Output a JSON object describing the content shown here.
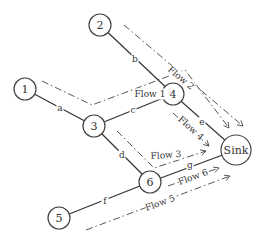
{
  "diagram": {
    "type": "network flow diagram",
    "nodes": [
      {
        "id": "1",
        "label": "1",
        "x": 25,
        "y": 89,
        "r": 11
      },
      {
        "id": "2",
        "label": "2",
        "x": 100,
        "y": 25,
        "r": 11
      },
      {
        "id": "3",
        "label": "3",
        "x": 94,
        "y": 126,
        "r": 11
      },
      {
        "id": "4",
        "label": "4",
        "x": 173,
        "y": 94,
        "r": 11
      },
      {
        "id": "5",
        "label": "5",
        "x": 59,
        "y": 218,
        "r": 11
      },
      {
        "id": "6",
        "label": "6",
        "x": 150,
        "y": 182,
        "r": 11
      },
      {
        "id": "sink",
        "label": "Sink",
        "x": 236,
        "y": 150,
        "r": 15
      }
    ],
    "edges": [
      {
        "id": "a",
        "label": "a",
        "from": "1",
        "to": "3",
        "lx": 60,
        "ly": 108
      },
      {
        "id": "b",
        "label": "b",
        "from": "2",
        "to": "4",
        "lx": 135,
        "ly": 59
      },
      {
        "id": "c",
        "label": "c",
        "from": "3",
        "to": "4",
        "lx": 133,
        "ly": 110
      },
      {
        "id": "d",
        "label": "d",
        "from": "3",
        "to": "6",
        "lx": 122,
        "ly": 155
      },
      {
        "id": "e",
        "label": "e",
        "from": "4",
        "to": "sink",
        "lx": 202,
        "ly": 122
      },
      {
        "id": "f",
        "label": "f",
        "from": "5",
        "to": "6",
        "lx": 105,
        "ly": 201
      },
      {
        "id": "g",
        "label": "g",
        "from": "6",
        "to": "sink",
        "lx": 190,
        "ly": 165
      }
    ],
    "flows": [
      {
        "id": "flow1",
        "label": "Flow 1",
        "path": "1 → 3 → 4 → Sink",
        "points": [
          [
            42,
            81
          ],
          [
            92,
            105
          ],
          [
            185,
            70
          ],
          [
            229,
            128
          ]
        ],
        "lx": 150,
        "ly": 94,
        "rot": 0
      },
      {
        "id": "flow2",
        "label": "Flow 2",
        "path": "2 → 4 → Sink",
        "points": [
          [
            124,
            25
          ],
          [
            243,
            126
          ]
        ],
        "lx": 181,
        "ly": 78,
        "rot": 40
      },
      {
        "id": "flow3",
        "label": "Flow 3",
        "path": "3 → 6 → Sink",
        "points": [
          [
            117,
            131
          ],
          [
            154,
            168
          ],
          [
            206,
            151
          ]
        ],
        "lx": 166,
        "ly": 155,
        "rot": -4
      },
      {
        "id": "flow4",
        "label": "Flow 4",
        "path": "4 → Sink",
        "points": [
          [
            173,
            113
          ],
          [
            209,
            146
          ]
        ],
        "lx": 191,
        "ly": 128,
        "rot": 42
      },
      {
        "id": "flow5",
        "label": "Flow 5",
        "path": "5 → 6 → Sink",
        "points": [
          [
            86,
            230
          ],
          [
            230,
            176
          ]
        ],
        "lx": 160,
        "ly": 203,
        "rot": -20
      },
      {
        "id": "flow6",
        "label": "Flow 6",
        "path": "6 → Sink",
        "points": [
          [
            168,
            186
          ],
          [
            219,
            168
          ]
        ],
        "lx": 193,
        "ly": 177,
        "rot": -20
      }
    ]
  },
  "colors": {
    "background": "#ffffff",
    "stroke": "#333333",
    "flow_stroke": "#555555",
    "text": "#333333"
  }
}
